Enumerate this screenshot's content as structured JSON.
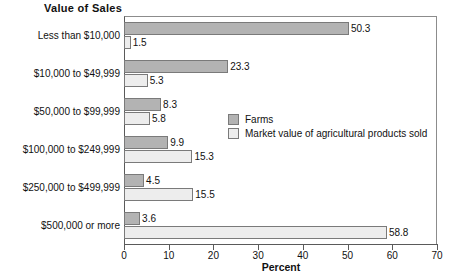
{
  "chart_data": {
    "type": "bar",
    "orientation": "horizontal",
    "title": "Value of Sales",
    "xlabel": "Percent",
    "ylabel": "",
    "xlim": [
      0,
      70
    ],
    "xticks": [
      0,
      10,
      20,
      30,
      40,
      50,
      60,
      70
    ],
    "grid": false,
    "legend_position": "center-right",
    "categories": [
      "Less than $10,000",
      "$10,000 to $49,999",
      "$50,000 to $99,999",
      "$100,000 to $249,999",
      "$250,000 to $499,999",
      "$500,000 or more"
    ],
    "series": [
      {
        "name": "Farms",
        "color": "#b3b3b3",
        "values": [
          50.3,
          23.3,
          8.3,
          9.9,
          4.5,
          3.6
        ]
      },
      {
        "name": "Market value of agricultural products sold",
        "color": "#ededed",
        "values": [
          1.5,
          5.3,
          5.8,
          15.3,
          15.5,
          58.8
        ]
      }
    ]
  },
  "legend": {
    "items": [
      {
        "label": "Farms"
      },
      {
        "label": "Market value of agricultural products sold"
      }
    ]
  }
}
